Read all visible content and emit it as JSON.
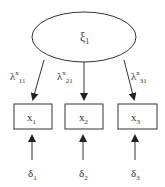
{
  "diagram": {
    "type": "measurement-model",
    "latent": {
      "label": "ξ",
      "subscript": "1"
    },
    "loadings": [
      {
        "symbol": "λ",
        "superscript": "x",
        "subscript": "11"
      },
      {
        "symbol": "λ",
        "superscript": "x",
        "subscript": "21"
      },
      {
        "symbol": "λ",
        "superscript": "x",
        "subscript": "31"
      }
    ],
    "indicators": [
      {
        "label": "x",
        "subscript": "1"
      },
      {
        "label": "x",
        "subscript": "2"
      },
      {
        "label": "x",
        "subscript": "3"
      }
    ],
    "errors": [
      {
        "label": "δ",
        "subscript": "1"
      },
      {
        "label": "δ",
        "subscript": "2"
      },
      {
        "label": "δ",
        "subscript": "3"
      }
    ],
    "colors": {
      "stroke": "#333333",
      "background": "#ffffff"
    }
  }
}
